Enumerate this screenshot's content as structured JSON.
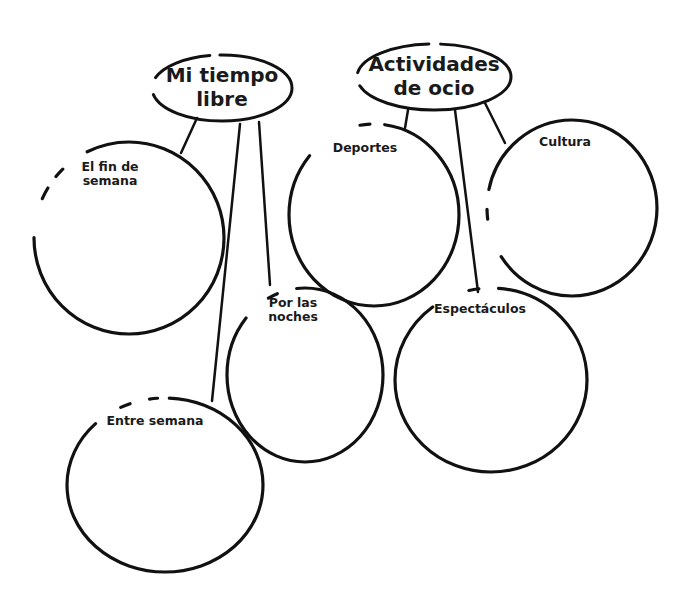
{
  "diagram": {
    "type": "mind-map",
    "hubs": [
      {
        "id": "mi-tiempo-libre",
        "label_line1": "Mi tiempo",
        "label_line2": "libre",
        "branches": [
          "El fin de semana",
          "Por las noches",
          "Entre semana"
        ]
      },
      {
        "id": "actividades-de-ocio",
        "label_line1": "Actividades",
        "label_line2": "de ocio",
        "branches": [
          "Deportes",
          "Cultura",
          "Espectáculos"
        ]
      }
    ],
    "nodes": {
      "fin_de_semana": {
        "line1": "El fin de",
        "line2": "semana"
      },
      "por_las_noches": {
        "line1": "Por las",
        "line2": "noches"
      },
      "entre_semana": {
        "line1": "Entre semana"
      },
      "deportes": {
        "line1": "Deportes"
      },
      "cultura": {
        "line1": "Cultura"
      },
      "espectaculos": {
        "line1": "Espectáculos"
      }
    },
    "stroke_color": "#111111",
    "background_color": "#ffffff"
  }
}
